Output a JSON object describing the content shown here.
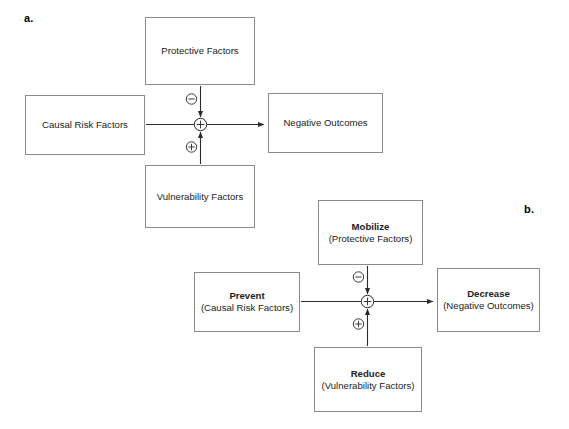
{
  "figure": {
    "background_color": "#ffffff",
    "line_color": "#2b2b2b",
    "box_border_color": "#8a8a8a"
  },
  "panels": {
    "a": {
      "label": "a.",
      "boxes": {
        "protective": {
          "line1": "Protective Factors",
          "line2": ""
        },
        "causal_risk": {
          "line1": "Causal Risk Factors",
          "line2": ""
        },
        "negative_outcomes": {
          "line1": "Negative Outcomes",
          "line2": ""
        },
        "vulnerability": {
          "line1": "Vulnerability Factors",
          "line2": ""
        }
      },
      "signs": {
        "top": "minus",
        "bottom": "plus",
        "junction": "plus"
      }
    },
    "b": {
      "label": "b.",
      "boxes": {
        "mobilize": {
          "line1": "Mobilize",
          "line2": "(Protective Factors)"
        },
        "prevent": {
          "line1": "Prevent",
          "line2": "(Causal Risk Factors)"
        },
        "decrease": {
          "line1": "Decrease",
          "line2": "(Negative Outcomes)"
        },
        "reduce": {
          "line1": "Reduce",
          "line2": "(Vulnerability Factors)"
        }
      },
      "signs": {
        "top": "minus",
        "bottom": "plus",
        "junction": "plus"
      }
    }
  }
}
